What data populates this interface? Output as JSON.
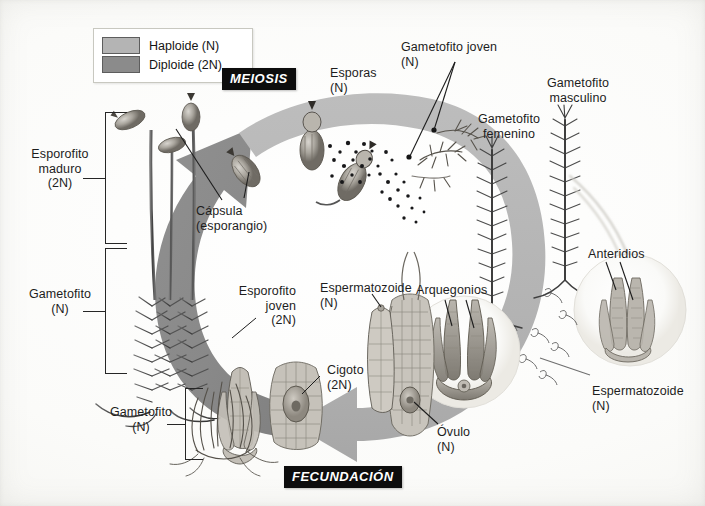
{
  "diagram": {
    "legend": {
      "items": [
        {
          "label": "Haploide (N)",
          "color": "#b4b4b4",
          "name": "haploid"
        },
        {
          "label": "Diploide (2N)",
          "color": "#8b8b8b",
          "name": "diploid"
        }
      ]
    },
    "banners": {
      "meiosis": "MEIOSIS",
      "fecundacion": "FECUNDACIÓN"
    },
    "labels": {
      "esporofito_maduro": "Esporofito\nmaduro\n(2N)",
      "gametofito_izq": "Gametofito\n(N)",
      "gametofito_inferior": "Gametofito\n(N)",
      "capsula": "Cápsula\n(esporangio)",
      "esporas": "Esporas\n(N)",
      "gametofito_joven": "Gametofito joven\n(N)",
      "gametofito_femenino": "Gametofito\nfemenino",
      "gametofito_masculino": "Gametofito\nmasculino",
      "anteridios": "Anteridios",
      "arquegonios": "Arquegonios",
      "espermatozoide_izq": "Espermatozoide\n(N)",
      "espermatozoide_der": "Espermatozoide\n(N)",
      "esporofito_joven": "Esporofito\njoven\n(2N)",
      "cigoto": "Cigoto\n(2N)",
      "ovulo": "Óvulo\n(N)"
    },
    "colors": {
      "haploid_arrow": "#b4b4b4",
      "diploid_arrow": "#8b8b8b",
      "banner_bg": "#0d0d0d",
      "banner_text": "#ffffff",
      "leader_line": "#1c1c1c",
      "background": "#fdfdfb"
    },
    "structures": {
      "cycle_direction": "clockwise",
      "arcs": [
        {
          "name": "diploid-arc",
          "phase": "2N",
          "from": "FECUNDACIÓN",
          "to": "MEIOSIS"
        },
        {
          "name": "haploid-arc",
          "phase": "N",
          "from": "MEIOSIS",
          "to": "FECUNDACIÓN"
        }
      ],
      "insets": [
        {
          "name": "archegonia-inset",
          "label": "Arquegonios"
        },
        {
          "name": "antheridia-inset",
          "label": "Anteridios"
        }
      ]
    }
  }
}
